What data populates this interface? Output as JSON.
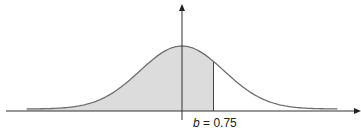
{
  "figure": {
    "label": {
      "variable": "b",
      "equals": " = ",
      "value": "0.75"
    },
    "colors": {
      "curve": "#6e6e6e",
      "fill": "#dcdcdc",
      "axis": "#333333",
      "background": "#ffffff"
    }
  },
  "chart_data": {
    "type": "area",
    "title": "",
    "xlabel": "",
    "ylabel": "",
    "distribution": "standard normal",
    "mean": 0,
    "std": 1,
    "shaded_region": {
      "from": "-inf",
      "to": 0.75
    },
    "annotations": [
      {
        "text": "b = 0.75",
        "x": 0.75
      }
    ],
    "xlim": [
      -3.7,
      3.7
    ],
    "grid": false
  }
}
